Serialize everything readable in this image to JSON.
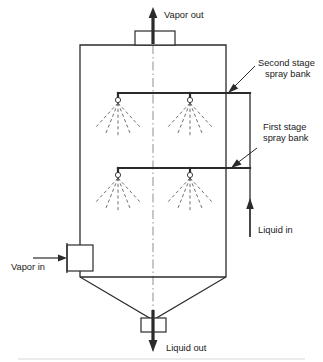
{
  "diagram": {
    "type": "process-flow-schematic",
    "colors": {
      "line": "#2b2b2b",
      "spray": "#555555",
      "centerline": "#9a9a9a",
      "background": "#ffffff",
      "text": "#1a1a1a"
    }
  },
  "labels": {
    "vapor_out": "Vapor out",
    "vapor_in": "Vapor in",
    "liquid_in": "Liquid in",
    "liquid_out": "Liquid out",
    "second_stage_line1": "Second stage",
    "second_stage_line2": "spray bank",
    "first_stage_line1": "First stage",
    "first_stage_line2": "spray bank"
  },
  "geometry": {
    "vessel": {
      "left": 80,
      "right": 226,
      "top": 45,
      "cone_start": 277,
      "cone_apex_y": 320
    },
    "second_stage_header_y": 93,
    "first_stage_header_y": 168,
    "nozzle_x": [
      118,
      190
    ],
    "riser_x": 250,
    "centerline_x": 153
  },
  "nozzles": {
    "second_stage_count": 2,
    "first_stage_count": 2,
    "spray_lines_per_nozzle": 5,
    "spray_length": 34
  }
}
